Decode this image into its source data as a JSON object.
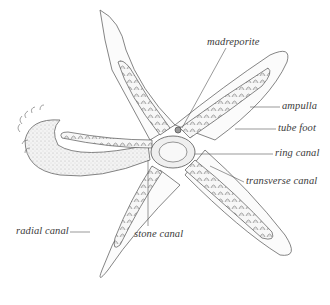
{
  "diagram": {
    "labels": [
      {
        "id": "madreporite",
        "text": "madreporite",
        "x": 207,
        "y": 42
      },
      {
        "id": "ampulla",
        "text": "ampulla",
        "x": 282,
        "y": 101
      },
      {
        "id": "tube-foot",
        "text": "tube foot",
        "x": 278,
        "y": 123
      },
      {
        "id": "ring-canal",
        "text": "ring canal",
        "x": 275,
        "y": 149
      },
      {
        "id": "transverse-canal",
        "text": "transverse canal",
        "x": 246,
        "y": 177
      },
      {
        "id": "radial-canal",
        "text": "radial canal",
        "x": 16,
        "y": 227
      },
      {
        "id": "stone-canal",
        "text": "stone canal",
        "x": 134,
        "y": 229
      }
    ],
    "colors": {
      "line": "#555555",
      "fill_light": "#f2f2f2",
      "fill_mid": "#d9d9d9",
      "text": "#3a3a3a",
      "background": "#ffffff"
    }
  }
}
